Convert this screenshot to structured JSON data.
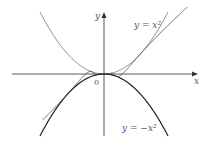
{
  "figure": {
    "upper_curve_label": "y = x²",
    "lower_curve_label": "y = −x²",
    "x_axis_label": "x",
    "y_axis_label": "y",
    "origin_label": "0",
    "colors": {
      "axes": "#333333",
      "upper": "#888888",
      "lower": "#222222",
      "oscillating": "#444444"
    }
  },
  "chart_data": {
    "type": "line",
    "title": "",
    "xlabel": "x",
    "ylabel": "y",
    "series": [
      {
        "name": "y = x^2",
        "function": "x^2"
      },
      {
        "name": "y = -x^2",
        "function": "-x^2"
      },
      {
        "name": "y = x^2 sin(1/x)",
        "function": "x^2*sin(1/x)"
      }
    ],
    "annotations": [
      "0"
    ],
    "grid": false
  }
}
